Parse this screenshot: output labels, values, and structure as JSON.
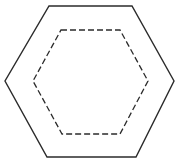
{
  "diagram": {
    "background": "#ffffff",
    "stroke_color": "#2b2b2b",
    "shapes": [
      {
        "id": "outer-hexagon",
        "type": "hexagon",
        "style": "solid",
        "stroke_width": 1.4,
        "points": "49,6 132,6 174,81 136,157 47,157 5,81"
      },
      {
        "id": "inner-hexagon",
        "type": "hexagon",
        "style": "dashed",
        "stroke_width": 1.3,
        "dasharray": "6 3",
        "points": "61,30 120,30 148,81 120,134 62,134 33,81"
      }
    ]
  }
}
